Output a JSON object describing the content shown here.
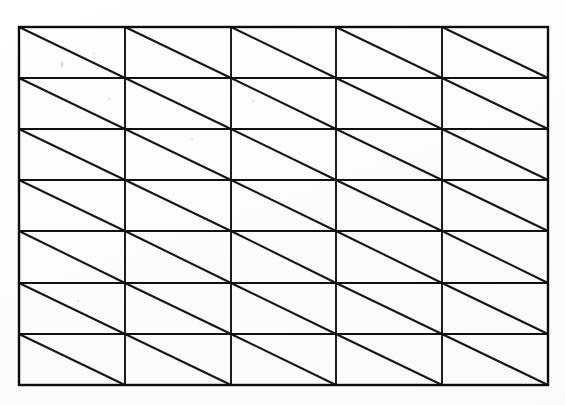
{
  "document": {
    "title": "Triangulated Rectangular Grid",
    "kind": "scanned line drawing",
    "background_color": "#fdfdfd",
    "ink_color": "#111111",
    "canvas": {
      "width": 565,
      "height": 405
    }
  },
  "figure": {
    "name": "triangulated-grid",
    "columns": 5,
    "rows": 7,
    "cell_count": 35,
    "triangle_count": 70,
    "diagonal_direction": "top-left-to-bottom-right",
    "bounds": {
      "left": 19,
      "top": 27,
      "right": 548,
      "bottom": 385
    },
    "cell_width": 105.8,
    "cell_height": 51.1,
    "column_x": [
      19,
      125,
      231,
      336,
      442,
      548
    ],
    "row_y": [
      27,
      78,
      129,
      180,
      231,
      283,
      334,
      385
    ],
    "outline_stroke_width": 2.4,
    "inner_stroke_width": 1.9,
    "diagonal_stroke_width": 2.1
  },
  "artifacts": {
    "label": "scan speckles",
    "specks": [
      {
        "x": 93,
        "y": 53,
        "w": 2,
        "h": 2
      },
      {
        "x": 61,
        "y": 62,
        "w": 2,
        "h": 5
      },
      {
        "x": 108,
        "y": 98,
        "w": 2,
        "h": 2
      },
      {
        "x": 252,
        "y": 100,
        "w": 2,
        "h": 2
      },
      {
        "x": 191,
        "y": 138,
        "w": 2,
        "h": 2
      },
      {
        "x": 320,
        "y": 218,
        "w": 2,
        "h": 2
      },
      {
        "x": 463,
        "y": 130,
        "w": 2,
        "h": 2
      },
      {
        "x": 77,
        "y": 300,
        "w": 2,
        "h": 2
      }
    ]
  }
}
